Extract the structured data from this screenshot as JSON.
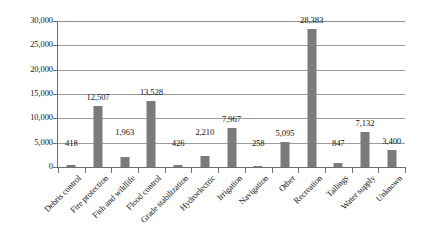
{
  "chart_data": {
    "type": "bar",
    "title": "",
    "subtitle": "",
    "xlabel": "",
    "ylabel": "",
    "ylim": [
      0,
      30000
    ],
    "yticks": [
      0,
      5000,
      10000,
      15000,
      20000,
      25000,
      30000
    ],
    "ytick_labels": [
      "0",
      "5,000",
      "10,000",
      "15,000",
      "20,000",
      "25,000",
      "30,000"
    ],
    "grid": "horizontal",
    "legend": "none",
    "bar_color": "#7b7b7b",
    "categories": [
      "Debris control",
      "Fire protection",
      "Fish and wildlife",
      "Flood control",
      "Grade stabilization",
      "Hydroelectric",
      "Irrigation",
      "Navigation",
      "Other",
      "Recreation",
      "Tailings",
      "Water supply",
      "Unknown"
    ],
    "values": [
      418,
      12507,
      1963,
      13528,
      426,
      2210,
      7967,
      258,
      5095,
      28383,
      847,
      7132,
      3400
    ],
    "value_labels": [
      "418",
      "12,507",
      "1,963",
      "13,528",
      "426",
      "2,210",
      "7,967",
      "258",
      "5,095",
      "28,383",
      "847",
      "7,132",
      "3,400"
    ]
  }
}
